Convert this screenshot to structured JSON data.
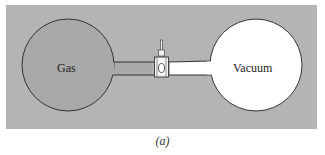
{
  "figure": {
    "caption": "(a)",
    "left_bulb": {
      "label": "Gas",
      "fill": "#a9a9a9"
    },
    "right_bulb": {
      "label": "Vacuum",
      "fill": "#ffffff"
    },
    "valve": {
      "name": "stopcock"
    },
    "background": "#b4b4b4"
  }
}
